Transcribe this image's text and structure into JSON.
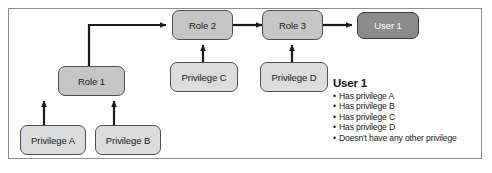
{
  "diagram": {
    "colors": {
      "frame_border": "#8d8d8d",
      "node_light": "#dcdcdc",
      "node_mid": "#c6c6c6",
      "node_dark": "#8c8c8c",
      "node_border": "#4f4f4f",
      "arrow": "#1a1a1a",
      "text": "#17191a",
      "text_inverse": "#ffffff"
    },
    "nodes": [
      {
        "id": "role2",
        "label": "Role 2",
        "style": "mid"
      },
      {
        "id": "role3",
        "label": "Role 3",
        "style": "mid"
      },
      {
        "id": "user1",
        "label": "User 1",
        "style": "dark"
      },
      {
        "id": "role1",
        "label": "Role 1",
        "style": "mid"
      },
      {
        "id": "privilege_c",
        "label": "Privilege C",
        "style": "light"
      },
      {
        "id": "privilege_d",
        "label": "Privilege D",
        "style": "light"
      },
      {
        "id": "privilege_a",
        "label": "Privilege A",
        "style": "light"
      },
      {
        "id": "privilege_b",
        "label": "Privilege B",
        "style": "light"
      }
    ],
    "edges": [
      {
        "from": "role1",
        "to": "role2",
        "shape": "elbow"
      },
      {
        "from": "privilege_c",
        "to": "role2",
        "shape": "vertical"
      },
      {
        "from": "role2",
        "to": "role3",
        "shape": "straight"
      },
      {
        "from": "privilege_d",
        "to": "role3",
        "shape": "vertical"
      },
      {
        "from": "role3",
        "to": "user1",
        "shape": "straight"
      },
      {
        "from": "privilege_a",
        "to": "role1",
        "shape": "vertical"
      },
      {
        "from": "privilege_b",
        "to": "role1",
        "shape": "vertical"
      }
    ]
  },
  "legend": {
    "title": "User 1",
    "bullet": "•",
    "items": [
      "Has privilege A",
      "Has privilege B",
      "Has privilege C",
      "Has privilege D",
      "Doesn't have any other privilege"
    ]
  }
}
